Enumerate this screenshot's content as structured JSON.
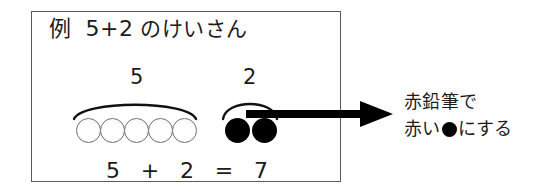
{
  "figure": {
    "title_text": "例　5+2 のけいさん",
    "header": {
      "label": "例",
      "expression": "5+2",
      "tail": "のけいさん"
    },
    "groups": [
      {
        "name": "addend-one",
        "caption": "5",
        "count": 5,
        "style": "open",
        "arc": "wide"
      },
      {
        "name": "addend-two",
        "caption": "2",
        "count": 2,
        "style": "filled",
        "arc": "narrow"
      }
    ],
    "equation": {
      "left_operand": "5",
      "operator": "+",
      "right_operand": "2",
      "equals": "=",
      "result": "7"
    },
    "annotation": {
      "line1": "赤鉛筆で",
      "line2_before": "赤い",
      "line2_symbol": "●",
      "line2_after": "にする"
    },
    "arrow": {
      "direction": "right",
      "name": "right-arrow"
    },
    "colors": {
      "ink": "#1b1b1b",
      "box_border": "#5a5a5a",
      "open_circle_outline": "#6f6f6f",
      "filled_circle": "#000000",
      "background": "#ffffff"
    }
  }
}
